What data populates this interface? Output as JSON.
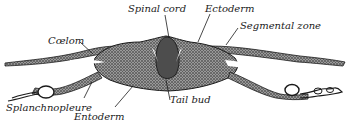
{
  "figure": {
    "labels": [
      {
        "id": "spinal-cord",
        "text": "Spinal cord"
      },
      {
        "id": "ectoderm",
        "text": "Ectoderm"
      },
      {
        "id": "segmental-zone",
        "text": "Segmental zone"
      },
      {
        "id": "coelom",
        "text": "Cœlom"
      },
      {
        "id": "splanchnopleure",
        "text": "Splanchnopleure"
      },
      {
        "id": "entoderm",
        "text": "Entoderm"
      },
      {
        "id": "tail-bud",
        "text": "Tail bud"
      }
    ]
  },
  "colors": {
    "ink": "#1a1a1a",
    "stipple": "#5a5a5a",
    "background": "#ffffff"
  }
}
